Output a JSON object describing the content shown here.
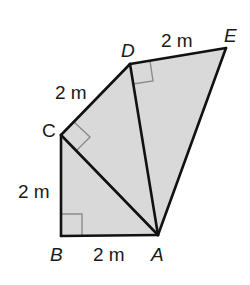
{
  "diagram": {
    "colors": {
      "fill": "#d9d9d9",
      "stroke": "#111111",
      "right_angle_mark": "#8a8a8a",
      "background": "#ffffff"
    },
    "points": {
      "A": {
        "label": "A",
        "x": 158,
        "y": 235
      },
      "B": {
        "label": "B",
        "x": 61,
        "y": 236
      },
      "C": {
        "label": "C",
        "x": 61,
        "y": 135
      },
      "D": {
        "label": "D",
        "x": 130,
        "y": 64
      },
      "E": {
        "label": "E",
        "x": 226,
        "y": 48
      }
    },
    "segments": [
      {
        "from": "B",
        "to": "A",
        "length_label": "2 m"
      },
      {
        "from": "B",
        "to": "C",
        "length_label": "2 m"
      },
      {
        "from": "C",
        "to": "D",
        "length_label": "2 m"
      },
      {
        "from": "D",
        "to": "E",
        "length_label": "2 m"
      },
      {
        "from": "C",
        "to": "A",
        "length_label": ""
      },
      {
        "from": "D",
        "to": "A",
        "length_label": ""
      },
      {
        "from": "E",
        "to": "A",
        "length_label": ""
      }
    ],
    "right_angles": [
      "B",
      "C",
      "D"
    ],
    "labels": {
      "A": "A",
      "B": "B",
      "C": "C",
      "D": "D",
      "E": "E",
      "BA": "2 m",
      "BC": "2 m",
      "CD": "2 m",
      "DE": "2 m"
    }
  }
}
